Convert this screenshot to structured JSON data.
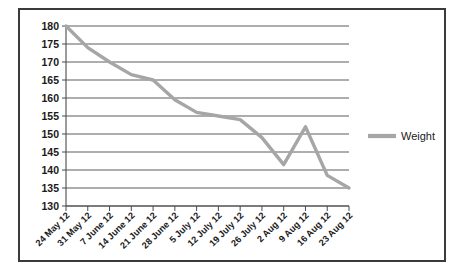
{
  "chart_data": {
    "type": "line",
    "title": "",
    "subtitle": "",
    "xlabel": "",
    "ylabel": "",
    "categories": [
      "24 May 12",
      "31 May 12",
      "7 June 12",
      "14 June 12",
      "21 June 12",
      "28 June 12",
      "5 July 12",
      "12 July 12",
      "19 July 12",
      "26 July 12",
      "2 Aug 12",
      "9 Aug 12",
      "16 Aug 12",
      "23 Aug 12"
    ],
    "series": [
      {
        "name": "Weight",
        "color": "#a6a6a6",
        "values": [
          180,
          174,
          170,
          166.5,
          165,
          159.5,
          156,
          155,
          154,
          149,
          141.5,
          152,
          138.5,
          135
        ]
      }
    ],
    "ylim": [
      130,
      180
    ],
    "yticks": [
      130,
      135,
      140,
      145,
      150,
      155,
      160,
      165,
      170,
      175,
      180
    ],
    "ytick_labels": [
      "130",
      "135",
      "140",
      "145",
      "150",
      "155",
      "160",
      "165",
      "170",
      "175",
      "180"
    ],
    "grid": true,
    "grid_axis": "y",
    "legend": {
      "position": "right",
      "entries": [
        {
          "label": "Weight",
          "color": "#a6a6a6"
        }
      ]
    },
    "colors": {
      "series_line": "#a6a6a6",
      "grid": "#4a4a4a",
      "axis": "#4a4a4a",
      "text": "#1a1a1a",
      "frame": "#3a3a3a",
      "background": "#ffffff"
    }
  }
}
